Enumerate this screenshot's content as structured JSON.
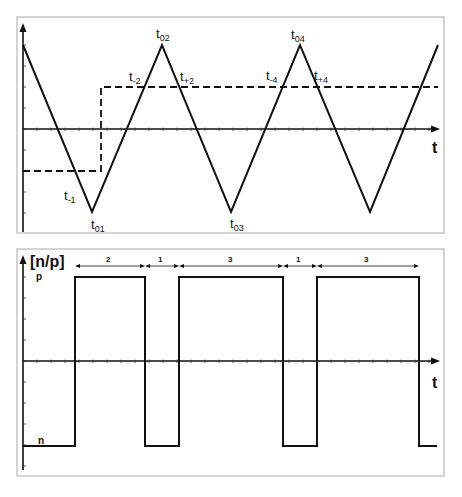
{
  "figure": {
    "top_panel": {
      "x_axis_label": "t",
      "signal_type": "triangle carrier with dashed step reference",
      "triangle_vertices": [
        {
          "t": 0,
          "level": 1,
          "label": ""
        },
        {
          "t": 1,
          "level": -1,
          "label": "t01"
        },
        {
          "t": 2,
          "level": 1,
          "label": "t02"
        },
        {
          "t": 3,
          "level": -1,
          "label": "t03"
        },
        {
          "t": 4,
          "level": 1,
          "label": "t04"
        },
        {
          "t": 5,
          "level": -1,
          "label": ""
        },
        {
          "t": 6,
          "level": 1,
          "label": ""
        }
      ],
      "reference_levels": {
        "before_step": -0.5,
        "after_step": 0.5,
        "step_at_t": 1.13
      },
      "labels": {
        "t_minus1": {
          "base": "t",
          "sub": "-1"
        },
        "t01": {
          "base": "t",
          "sub": "01"
        },
        "t02": {
          "base": "t",
          "sub": "02"
        },
        "t_minus2": {
          "base": "t",
          "sub": "-2"
        },
        "t_plus2": {
          "base": "t",
          "sub": "+2"
        },
        "t03": {
          "base": "t",
          "sub": "03"
        },
        "t04": {
          "base": "t",
          "sub": "04"
        },
        "t_minus4": {
          "base": "t",
          "sub": "-4"
        },
        "t_plus4": {
          "base": "t",
          "sub": "+4"
        }
      }
    },
    "bottom_panel": {
      "y_axis_label": "[n/p]",
      "x_axis_label": "t",
      "level_high_label": "p",
      "level_low_label": "n",
      "segments": [
        {
          "state": "n",
          "from": 0,
          "to": 0.75
        },
        {
          "state": "p",
          "from": 0.75,
          "to": 1.75
        },
        {
          "state": "n",
          "from": 1.75,
          "to": 2.25
        },
        {
          "state": "p",
          "from": 2.25,
          "to": 3.75
        },
        {
          "state": "n",
          "from": 3.75,
          "to": 4.25
        },
        {
          "state": "p",
          "from": 4.25,
          "to": 5.75
        },
        {
          "state": "n",
          "from": 5.75,
          "to": 6
        }
      ],
      "duration_marks": [
        "2",
        "1",
        "3",
        "1",
        "3"
      ]
    }
  }
}
